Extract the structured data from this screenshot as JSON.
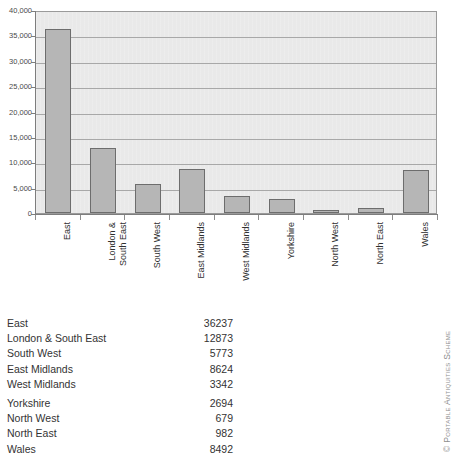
{
  "chart_data": {
    "type": "bar",
    "title": "",
    "xlabel": "",
    "ylabel": "",
    "categories": [
      "East",
      "London & South East",
      "South West",
      "East Midlands",
      "West Midlands",
      "Yorkshire",
      "North West",
      "North East",
      "Wales"
    ],
    "category_labels_display": [
      "East",
      "London &\nSouth East",
      "South West",
      "East Midlands",
      "West Midlands",
      "Yorkshire",
      "North West",
      "North East",
      "Wales"
    ],
    "values": [
      36237,
      12873,
      5773,
      8624,
      3342,
      2694,
      679,
      982,
      8492
    ],
    "ylim": [
      0,
      40000
    ],
    "ytick_labels": [
      "0",
      "5,000",
      "10,000",
      "15,000",
      "20,000",
      "25,000",
      "30,000",
      "35,000",
      "40,000"
    ],
    "ytick_values": [
      0,
      5000,
      10000,
      15000,
      20000,
      25000,
      30000,
      35000,
      40000
    ],
    "grid": true,
    "legend": null,
    "bar_color": "#b6b6b6",
    "bar_border_color": "#6d6d6d",
    "plot_background": "#e9e9e9",
    "gridline_color": "#a8a8a8"
  },
  "table": {
    "rows": [
      {
        "label": "East",
        "value": "36237"
      },
      {
        "label": "London & South East",
        "value": "12873"
      },
      {
        "label": "South West",
        "value": "5773"
      },
      {
        "label": "East Midlands",
        "value": "8624"
      },
      {
        "label": "West Midlands",
        "value": "3342"
      },
      {
        "label": "Yorkshire",
        "value": "2694"
      },
      {
        "label": "North West",
        "value": "679"
      },
      {
        "label": "North East",
        "value": "982"
      },
      {
        "label": "Wales",
        "value": "8492"
      }
    ]
  },
  "credit": {
    "text": "© Portable Antiquities Scheme"
  }
}
